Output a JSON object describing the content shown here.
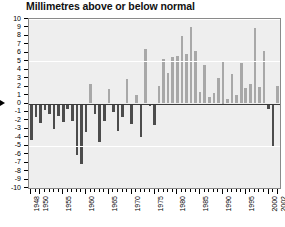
{
  "chart_data": {
    "type": "bar",
    "title": "Millimetres above or below normal",
    "xlabel": "",
    "ylabel": "",
    "ylim": [
      -10,
      10
    ],
    "ytick_step": 1,
    "yticks": [
      10,
      9,
      8,
      7,
      6,
      5,
      4,
      3,
      2,
      1,
      0,
      -1,
      -2,
      -3,
      -4,
      -5,
      -6,
      -7,
      -8,
      -9,
      -10
    ],
    "xlim": [
      1948,
      2002
    ],
    "xtick_labels": [
      "1948",
      "1950",
      "1955",
      "1960",
      "1965",
      "1970",
      "1975",
      "1980",
      "1985",
      "1990",
      "1995",
      "2000",
      "2002"
    ],
    "grid": true,
    "legend": "none",
    "colors": {
      "positive_bar": "#a8a8a8",
      "negative_bar": "#4c4c4c",
      "plot_background": "#eeeeee",
      "gridline": "#ffffff",
      "zero_line": "#3a3a3a",
      "frame": "#8a8a8a",
      "page_background": "#ffffff",
      "text": "#000000"
    },
    "categories": [
      1948,
      1949,
      1950,
      1951,
      1952,
      1953,
      1954,
      1955,
      1956,
      1957,
      1958,
      1959,
      1960,
      1961,
      1962,
      1963,
      1964,
      1965,
      1966,
      1967,
      1968,
      1969,
      1970,
      1971,
      1972,
      1973,
      1974,
      1975,
      1976,
      1977,
      1978,
      1979,
      1980,
      1981,
      1982,
      1983,
      1984,
      1985,
      1986,
      1987,
      1988,
      1989,
      1990,
      1991,
      1992,
      1993,
      1994,
      1995,
      1996,
      1997,
      1998,
      1999,
      2000,
      2001,
      2002
    ],
    "values": [
      -4.3,
      -1.6,
      -2.3,
      -0.8,
      -1.2,
      -3.0,
      -1.5,
      -2.2,
      -0.6,
      -2.1,
      -6.1,
      -7.2,
      -3.4,
      2.3,
      -1.3,
      -4.6,
      -2.1,
      1.7,
      -1.0,
      -3.2,
      -1.6,
      2.9,
      -2.4,
      1.0,
      -4.0,
      6.4,
      -0.3,
      -2.5,
      2.1,
      5.3,
      3.6,
      5.5,
      5.6,
      8.0,
      5.9,
      9.1,
      6.2,
      1.4,
      4.6,
      0.8,
      1.2,
      3.0,
      5.0,
      0.5,
      3.5,
      1.0,
      4.8,
      1.8,
      2.3,
      8.9,
      1.9,
      6.2,
      -0.6,
      -5.0,
      2.1
    ]
  }
}
